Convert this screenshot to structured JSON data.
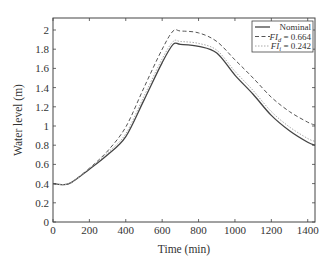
{
  "chart_data": {
    "type": "line",
    "title": "",
    "xlabel": "Time (min)",
    "ylabel": "Water level (m)",
    "xlim": [
      0,
      1440
    ],
    "ylim": [
      0,
      2.125
    ],
    "xticks": [
      0,
      200,
      400,
      600,
      800,
      1000,
      1200,
      1400
    ],
    "xtick_labels": [
      "0",
      "200",
      "400",
      "600",
      "800",
      "1000",
      "1200",
      "1400"
    ],
    "yticks": [
      0,
      0.2,
      0.4,
      0.6,
      0.8,
      1,
      1.2,
      1.4,
      1.6,
      1.8,
      2
    ],
    "ytick_labels": [
      "0",
      "0.2",
      "0.4",
      "0.6",
      "0.8",
      "1",
      "1.2",
      "1.4",
      "1.6",
      "1.8",
      "2"
    ],
    "grid": false,
    "legend_position": "upper right",
    "x": [
      0,
      50,
      100,
      200,
      300,
      400,
      500,
      600,
      660,
      700,
      800,
      900,
      1000,
      1100,
      1200,
      1300,
      1400,
      1440
    ],
    "series": [
      {
        "name": "Nominal",
        "style": "solid",
        "color": "#444444",
        "values": [
          0.4,
          0.39,
          0.41,
          0.55,
          0.7,
          0.89,
          1.27,
          1.66,
          1.85,
          1.85,
          1.83,
          1.76,
          1.53,
          1.33,
          1.11,
          0.95,
          0.83,
          0.8
        ]
      },
      {
        "name": "FI_d = 0.664",
        "style": "dashed",
        "color": "#555555",
        "values": [
          0.4,
          0.39,
          0.41,
          0.56,
          0.74,
          0.99,
          1.4,
          1.8,
          1.99,
          1.99,
          1.97,
          1.88,
          1.69,
          1.5,
          1.3,
          1.15,
          1.04,
          1.01
        ]
      },
      {
        "name": "FI_i = 0.242",
        "style": "dotted",
        "color": "#aaaaaa",
        "values": [
          0.4,
          0.39,
          0.41,
          0.56,
          0.72,
          0.92,
          1.31,
          1.7,
          1.88,
          1.88,
          1.86,
          1.79,
          1.57,
          1.37,
          1.15,
          0.99,
          0.87,
          0.84
        ]
      }
    ]
  },
  "legend": {
    "items": [
      {
        "label": "Nominal",
        "base": "Nominal",
        "sub": "",
        "rest": ""
      },
      {
        "label": "FI_d = 0.664",
        "base": "FI",
        "sub": "d",
        "rest": " = 0.664"
      },
      {
        "label": "FI_i = 0.242",
        "base": "FI",
        "sub": "i",
        "rest": " = 0.242"
      }
    ]
  }
}
